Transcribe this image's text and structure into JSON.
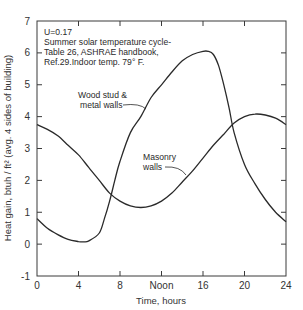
{
  "chart_data": {
    "type": "line",
    "title": "",
    "xlabel": "Time, hours",
    "ylabel": "Heat gain, btuh / ft² (avg. 4 sides of building)",
    "xlim": [
      0,
      24
    ],
    "ylim": [
      -1,
      7
    ],
    "x_ticks": [
      0,
      4,
      8,
      12,
      16,
      20,
      24
    ],
    "x_tick_labels": [
      "0",
      "4",
      "8",
      "Noon",
      "16",
      "20",
      "24"
    ],
    "y_ticks": [
      -1,
      0,
      1,
      2,
      3,
      4,
      5,
      6,
      7
    ],
    "y_tick_labels": [
      "-1",
      "0",
      "1",
      "2",
      "3",
      "4",
      "5",
      "6",
      "7"
    ],
    "grid": false,
    "annotations": [
      "U=0.17",
      "Summer solar temperature cycle-",
      "Table 26, ASHRAE handbook,",
      "Ref.29.Indoor temp. 79° F."
    ],
    "series": [
      {
        "name": "Wood stud & metal walls",
        "x": [
          0,
          1,
          2,
          3,
          4,
          4.5,
          5,
          6,
          6.5,
          7,
          7.5,
          8,
          9,
          10,
          11,
          12,
          13,
          14,
          15,
          16,
          16.5,
          17,
          17.5,
          18,
          18.5,
          19,
          20,
          21,
          22,
          23,
          24
        ],
        "values": [
          0.8,
          0.5,
          0.3,
          0.15,
          0.08,
          0.07,
          0.1,
          0.35,
          0.8,
          1.35,
          2.0,
          2.6,
          3.5,
          4.0,
          4.6,
          5.0,
          5.4,
          5.75,
          5.95,
          6.05,
          6.05,
          5.95,
          5.6,
          5.0,
          4.3,
          3.5,
          2.5,
          1.9,
          1.4,
          1.0,
          0.7
        ]
      },
      {
        "name": "Masonry walls",
        "x": [
          0,
          1,
          2,
          3,
          4,
          5,
          6,
          7,
          8,
          9,
          10,
          11,
          12,
          13,
          14,
          15,
          16,
          17,
          18,
          19,
          20,
          21,
          22,
          23,
          24
        ],
        "values": [
          3.75,
          3.6,
          3.4,
          3.1,
          2.8,
          2.4,
          2.0,
          1.6,
          1.35,
          1.2,
          1.15,
          1.2,
          1.35,
          1.6,
          1.95,
          2.3,
          2.7,
          3.1,
          3.45,
          3.8,
          4.0,
          4.08,
          4.05,
          3.95,
          3.75
        ]
      }
    ]
  },
  "labels": {
    "wood_line1": "Wood stud &",
    "wood_line2": "metal walls",
    "masonry_line1": "Masonry",
    "masonry_line2": "walls"
  }
}
